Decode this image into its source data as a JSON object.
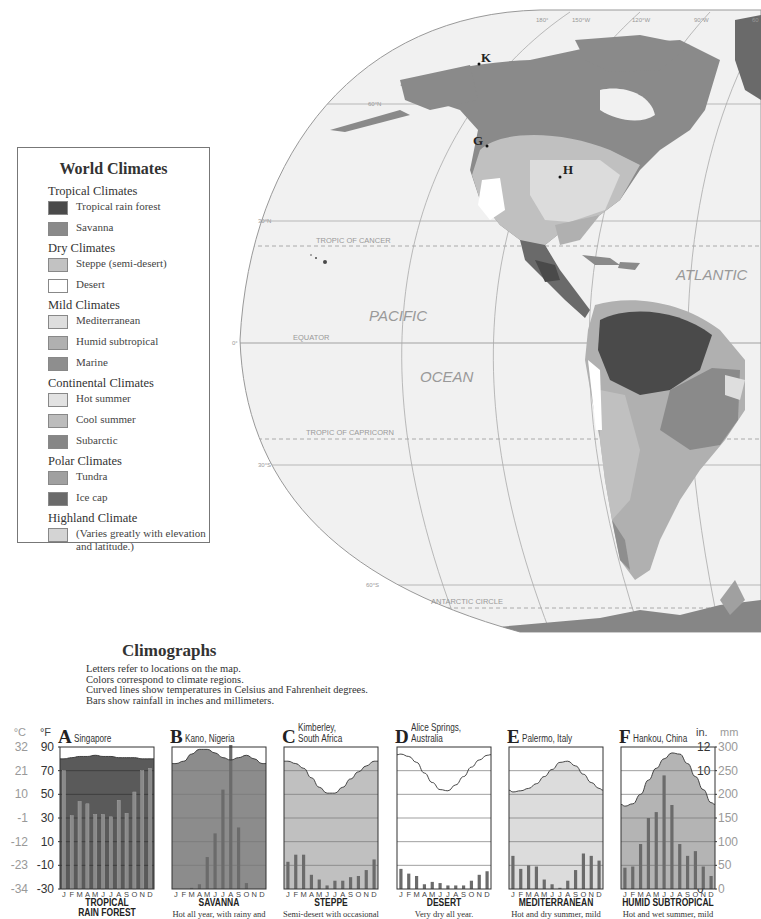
{
  "map": {
    "title": "World Climates map (Americas)",
    "meridian_labels": [
      "180°",
      "150°W",
      "120°W",
      "90°W",
      "60°"
    ],
    "parallel_labels": [
      "60°N",
      "30°N",
      "0°",
      "30°S",
      "60°S"
    ],
    "lines": [
      "TROPIC OF CANCER",
      "EQUATOR",
      "TROPIC OF CAPRICORN",
      "ANTARCTIC CIRCLE"
    ],
    "oceans": [
      "PACIFIC",
      "OCEAN",
      "ATLANTIC"
    ],
    "markers": [
      {
        "letter": "K",
        "x": 478,
        "y": 64
      },
      {
        "letter": "G",
        "x": 486,
        "y": 146
      },
      {
        "letter": "H",
        "x": 560,
        "y": 177
      }
    ]
  },
  "legend": {
    "title": "World Climates",
    "groups": [
      {
        "name": "Tropical Climates",
        "items": [
          {
            "label": "Tropical rain forest",
            "color": "#4a4a4a"
          },
          {
            "label": "Savanna",
            "color": "#8a8a8a"
          }
        ]
      },
      {
        "name": "Dry Climates",
        "items": [
          {
            "label": "Steppe (semi-desert)",
            "color": "#c2c2c2"
          },
          {
            "label": "Desert",
            "color": "#ffffff"
          }
        ]
      },
      {
        "name": "Mild Climates",
        "items": [
          {
            "label": "Mediterranean",
            "color": "#dedede"
          },
          {
            "label": "Humid subtropical",
            "color": "#b0b0b0"
          },
          {
            "label": "Marine",
            "color": "#8e8e8e"
          }
        ]
      },
      {
        "name": "Continental Climates",
        "items": [
          {
            "label": "Hot summer",
            "color": "#e2e2e2"
          },
          {
            "label": "Cool summer",
            "color": "#bcbcbc"
          },
          {
            "label": "Subarctic",
            "color": "#868686"
          }
        ]
      },
      {
        "name": "Polar Climates",
        "items": [
          {
            "label": "Tundra",
            "color": "#a0a0a0"
          },
          {
            "label": "Ice cap",
            "color": "#6a6a6a"
          }
        ]
      },
      {
        "name": "Highland Climate",
        "items": [
          {
            "label": "(Varies greatly with elevation and latitude.)",
            "color": "#d4d4d4"
          }
        ]
      }
    ]
  },
  "climographs": {
    "title": "Climographs",
    "description": [
      "Letters refer to locations on the map.",
      "Colors correspond to climate regions.",
      "Curved lines show temperatures in Celsius and Fahrenheit degrees.",
      "Bars show rainfall in inches and millimeters."
    ],
    "left_axis": {
      "c_label": "°C",
      "f_label": "°F",
      "c_ticks": [
        "32",
        "21",
        "10",
        "-1",
        "-12",
        "-23",
        "-34"
      ],
      "f_ticks": [
        "90",
        "70",
        "50",
        "30",
        "10",
        "-10",
        "-30"
      ]
    },
    "right_axis": {
      "in_label": "in.",
      "mm_label": "mm",
      "in_ticks": [
        "12",
        "10",
        "8",
        "6",
        "4",
        "2",
        "0"
      ],
      "mm_ticks": [
        "300",
        "250",
        "200",
        "150",
        "100",
        "50",
        "0"
      ]
    },
    "months": [
      "J",
      "F",
      "M",
      "A",
      "M",
      "J",
      "J",
      "A",
      "S",
      "O",
      "N",
      "D"
    ]
  },
  "chart_data": [
    {
      "type": "bar+line",
      "letter": "A",
      "title": "Singapore",
      "climate": "TROPICAL RAIN FOREST",
      "caption": "",
      "fill": "#5a5a5a",
      "categories": [
        "J",
        "F",
        "M",
        "A",
        "M",
        "J",
        "J",
        "A",
        "S",
        "O",
        "N",
        "D"
      ],
      "temperature_f": [
        80,
        81,
        82,
        82,
        83,
        82,
        82,
        81,
        81,
        81,
        80,
        80
      ],
      "rainfall_in": [
        10,
        6.2,
        7.4,
        7.2,
        6.3,
        6.3,
        6.1,
        7.5,
        6.4,
        8.2,
        10,
        10.2
      ],
      "ylim_f": [
        -30,
        90
      ],
      "ylim_in": [
        0,
        12
      ]
    },
    {
      "type": "bar+line",
      "letter": "B",
      "title": "Kano, Nigeria",
      "climate": "SAVANNA",
      "caption": "Hot all year, with rainy and",
      "fill": "#8c8c8c",
      "categories": [
        "J",
        "F",
        "M",
        "A",
        "M",
        "J",
        "J",
        "A",
        "S",
        "O",
        "N",
        "D"
      ],
      "temperature_f": [
        76,
        78,
        84,
        88,
        88,
        85,
        81,
        79,
        81,
        83,
        80,
        76
      ],
      "rainfall_in": [
        0,
        0,
        0.1,
        0.4,
        2.7,
        4.7,
        8.4,
        12.5,
        5.2,
        0.5,
        0,
        0
      ],
      "ylim_f": [
        -30,
        90
      ],
      "ylim_in": [
        0,
        12
      ]
    },
    {
      "type": "bar+line",
      "letter": "C",
      "title": "Kimberley, South Africa",
      "climate": "STEPPE",
      "caption": "Semi-desert with occasional",
      "fill": "#c0c0c0",
      "categories": [
        "J",
        "F",
        "M",
        "A",
        "M",
        "J",
        "J",
        "A",
        "S",
        "O",
        "N",
        "D"
      ],
      "temperature_f": [
        78,
        76,
        72,
        64,
        56,
        51,
        51,
        56,
        63,
        69,
        74,
        78
      ],
      "rainfall_in": [
        2.3,
        2.9,
        2.9,
        1.2,
        0.8,
        0.3,
        0.7,
        0.7,
        1.0,
        1.1,
        1.6,
        2.5
      ],
      "ylim_f": [
        -30,
        90
      ],
      "ylim_in": [
        0,
        12
      ]
    },
    {
      "type": "bar+line",
      "letter": "D",
      "title": "Alice Springs, Australia",
      "climate": "DESERT",
      "caption": "Very dry all year.",
      "fill": "#ffffff",
      "categories": [
        "J",
        "F",
        "M",
        "A",
        "M",
        "J",
        "J",
        "A",
        "S",
        "O",
        "N",
        "D"
      ],
      "temperature_f": [
        84,
        82,
        77,
        68,
        60,
        54,
        53,
        58,
        65,
        73,
        79,
        83
      ],
      "rainfall_in": [
        1.7,
        1.3,
        1.1,
        0.4,
        0.6,
        0.5,
        0.3,
        0.3,
        0.3,
        0.7,
        1.2,
        1.5
      ],
      "ylim_f": [
        -30,
        90
      ],
      "ylim_in": [
        0,
        12
      ]
    },
    {
      "type": "bar+line",
      "letter": "E",
      "title": "Palermo, Italy",
      "climate": "MEDITERRANEAN",
      "caption": "Hot and dry summer, mild",
      "fill": "#dcdcdc",
      "categories": [
        "J",
        "F",
        "M",
        "A",
        "M",
        "J",
        "J",
        "A",
        "S",
        "O",
        "N",
        "D"
      ],
      "temperature_f": [
        52,
        53,
        55,
        59,
        65,
        71,
        77,
        78,
        74,
        67,
        60,
        55
      ],
      "rainfall_in": [
        2.8,
        1.7,
        2.0,
        1.9,
        0.8,
        0.4,
        0.1,
        0.7,
        1.6,
        3.0,
        2.8,
        2.4
      ],
      "ylim_f": [
        -30,
        90
      ],
      "ylim_in": [
        0,
        12
      ]
    },
    {
      "type": "bar+line",
      "letter": "F",
      "title": "Hankou, China",
      "climate": "HUMID SUBTROPICAL",
      "caption": "Hot and wet summer, mild",
      "fill": "#b4b4b4",
      "categories": [
        "J",
        "F",
        "M",
        "A",
        "M",
        "J",
        "J",
        "A",
        "S",
        "O",
        "N",
        "D"
      ],
      "temperature_f": [
        40,
        42,
        50,
        62,
        72,
        80,
        85,
        84,
        76,
        65,
        54,
        43
      ],
      "rainfall_in": [
        1.8,
        1.9,
        3.8,
        6.0,
        6.5,
        9.6,
        7.1,
        3.8,
        2.8,
        3.2,
        1.9,
        1.1
      ],
      "ylim_f": [
        -30,
        90
      ],
      "ylim_in": [
        0,
        12
      ]
    }
  ]
}
